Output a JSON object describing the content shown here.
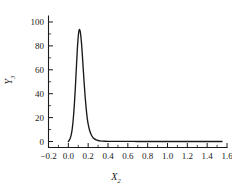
{
  "chart_data": {
    "type": "line",
    "title": "",
    "subtitle": "",
    "xlabel": "X",
    "xlabel_sub": "2",
    "ylabel": "Y",
    "ylabel_sub": "3",
    "xlim": [
      -0.2,
      1.6
    ],
    "ylim": [
      -5,
      105
    ],
    "grid": false,
    "legend": null,
    "line_color": "#1a1a1a",
    "axis_color": "#1a1a1a",
    "background": "#ffffff",
    "xticks": [
      -0.2,
      0.0,
      0.2,
      0.4,
      0.6,
      0.8,
      1.0,
      1.2,
      1.4,
      1.6
    ],
    "xtick_labels": [
      "-0.2",
      "0.0",
      "0.2",
      "0.4",
      "0.6",
      "0.8",
      "1.0",
      "1.2",
      "1.4",
      "1.6"
    ],
    "xminor_step": 0.1,
    "yticks": [
      0,
      20,
      40,
      60,
      80,
      100
    ],
    "ytick_labels": [
      "0",
      "20",
      "40",
      "60",
      "80",
      "100"
    ],
    "yminor_step": 10,
    "peak": {
      "x": 0.11,
      "y": 93.5
    },
    "series": [
      {
        "name": "Y3",
        "x": [
          0.0,
          0.01,
          0.02,
          0.03,
          0.04,
          0.05,
          0.06,
          0.07,
          0.08,
          0.09,
          0.1,
          0.11,
          0.12,
          0.13,
          0.14,
          0.15,
          0.16,
          0.17,
          0.18,
          0.19,
          0.2,
          0.215,
          0.23,
          0.245,
          0.26,
          0.28,
          0.3,
          0.32,
          0.34,
          0.37,
          0.4,
          0.45,
          0.5,
          0.6,
          0.7,
          0.8,
          0.9,
          1.0,
          1.1,
          1.2,
          1.3,
          1.4,
          1.5,
          1.55
        ],
        "y": [
          0.0,
          1.2,
          3.0,
          6.0,
          11.0,
          19.0,
          30.0,
          44.0,
          60.0,
          76.0,
          88.0,
          93.5,
          92.0,
          85.0,
          74.0,
          61.0,
          48.5,
          37.0,
          27.5,
          20.0,
          14.5,
          9.2,
          5.8,
          3.7,
          2.4,
          1.4,
          0.85,
          0.55,
          0.38,
          0.25,
          0.18,
          0.12,
          0.1,
          0.08,
          0.06,
          0.05,
          0.04,
          0.03,
          0.03,
          0.02,
          0.02,
          0.02,
          0.01,
          0.01
        ]
      }
    ]
  }
}
